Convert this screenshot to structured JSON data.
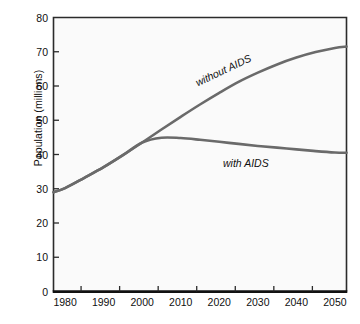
{
  "chart_data": {
    "type": "line",
    "title": "",
    "xlabel": "",
    "ylabel": "Population (millions)",
    "xlim": [
      1977,
      2053
    ],
    "ylim": [
      0,
      80
    ],
    "grid": false,
    "legend_position": "inline-annotations",
    "xticks": [
      1980,
      1990,
      2000,
      2010,
      2020,
      2030,
      2040,
      2050
    ],
    "xtick_labels": [
      "1980",
      "1990",
      "2000",
      "2010",
      "2020",
      "2030",
      "2040",
      "2050"
    ],
    "yticks": [
      0,
      10,
      20,
      30,
      40,
      50,
      60,
      70,
      80
    ],
    "ytick_labels": [
      "0",
      "10",
      "20",
      "30",
      "40",
      "50",
      "60",
      "70",
      "80"
    ],
    "line_color": "#6a6a6a",
    "line_width": 2.6,
    "series": [
      {
        "name": "without AIDS",
        "label": "without AIDS",
        "x": [
          1977,
          1980,
          1985,
          1990,
          1995,
          2000,
          2005,
          2010,
          2015,
          2020,
          2025,
          2030,
          2035,
          2040,
          2045,
          2050,
          2053
        ],
        "values": [
          29.0,
          30.2,
          33.2,
          36.3,
          39.8,
          43.5,
          47.3,
          51.0,
          54.6,
          58.0,
          61.2,
          63.9,
          66.3,
          68.3,
          69.9,
          71.1,
          71.5
        ]
      },
      {
        "name": "with AIDS",
        "label": "with AIDS",
        "x": [
          1977,
          1980,
          1985,
          1990,
          1995,
          2000,
          2005,
          2010,
          2015,
          2020,
          2025,
          2030,
          2035,
          2040,
          2045,
          2050,
          2053
        ],
        "values": [
          29.0,
          30.2,
          33.2,
          36.3,
          39.8,
          43.5,
          44.9,
          44.8,
          44.3,
          43.7,
          43.1,
          42.5,
          42.0,
          41.5,
          41.0,
          40.6,
          40.5
        ]
      }
    ],
    "annotations": [
      {
        "text": "without AIDS",
        "x": 2014,
        "y": 56.5,
        "rotation": -25.5,
        "style": "italic"
      },
      {
        "text": "with AIDS",
        "x": 2029,
        "y": 39.5,
        "rotation": 0,
        "style": "italic"
      }
    ]
  },
  "axes": {
    "background": "#fafafa",
    "frame_color": "#2b2b2b",
    "baseline_color": "#111111"
  }
}
